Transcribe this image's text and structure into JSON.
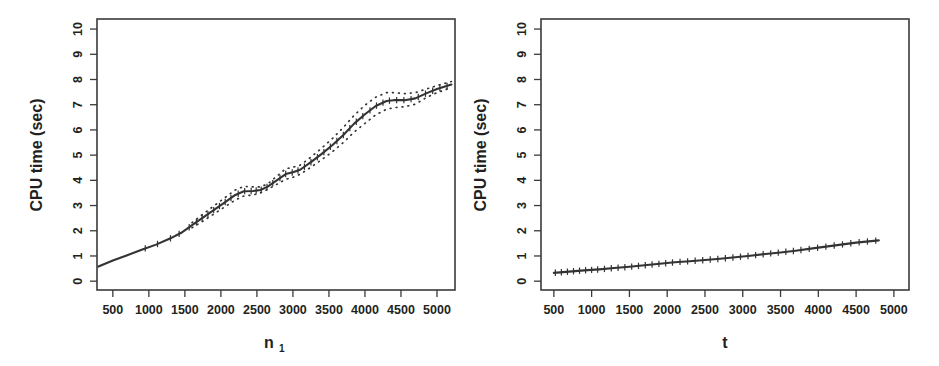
{
  "figure": {
    "title": "",
    "background_color": "#ffffff",
    "line_color": "#333333",
    "axis_color": "#3a3a3a"
  },
  "chart_data": [
    {
      "type": "line",
      "panel": "left",
      "title": "",
      "xlabel": "n₁",
      "xlabel_base": "n",
      "xlabel_subscript": "1",
      "ylabel": "CPU time (sec)",
      "xlim": [
        280,
        5250
      ],
      "ylim": [
        -0.35,
        10.4
      ],
      "xticks": [
        500,
        1000,
        1500,
        2000,
        2500,
        3000,
        3500,
        4000,
        4500,
        5000
      ],
      "xticklabels": [
        "500",
        "1000",
        "1500",
        "2000",
        "2500",
        "3000",
        "3500",
        "4000",
        "4500",
        "5000"
      ],
      "yticks": [
        0,
        1,
        2,
        3,
        4,
        5,
        6,
        7,
        8,
        9,
        10
      ],
      "yticklabels": [
        "0",
        "1",
        "2",
        "3",
        "4",
        "5",
        "6",
        "7",
        "8",
        "9",
        "10"
      ],
      "grid": false,
      "legend": "none",
      "series": [
        {
          "name": "fit",
          "style": "solid",
          "x": [
            300,
            500,
            700,
            900,
            1100,
            1300,
            1450,
            1600,
            1750,
            1900,
            2050,
            2200,
            2320,
            2450,
            2550,
            2650,
            2800,
            2900,
            3000,
            3100,
            3250,
            3400,
            3550,
            3700,
            3850,
            4000,
            4150,
            4300,
            4400,
            4550,
            4700,
            4850,
            5000,
            5200
          ],
          "y": [
            0.58,
            0.82,
            1.03,
            1.25,
            1.45,
            1.7,
            1.92,
            2.22,
            2.52,
            2.82,
            3.12,
            3.42,
            3.57,
            3.58,
            3.62,
            3.75,
            4.05,
            4.25,
            4.32,
            4.42,
            4.72,
            5.05,
            5.4,
            5.8,
            6.25,
            6.62,
            6.95,
            7.15,
            7.18,
            7.18,
            7.25,
            7.45,
            7.62,
            7.8
          ]
        },
        {
          "name": "upper band",
          "style": "dotted",
          "x": [
            1600,
            1750,
            1900,
            2050,
            2200,
            2320,
            2450,
            2550,
            2650,
            2800,
            2900,
            3000,
            3100,
            3250,
            3400,
            3550,
            3700,
            3850,
            4000,
            4150,
            4300,
            4400,
            4550,
            4700,
            4850,
            5000,
            5200
          ],
          "y": [
            2.32,
            2.66,
            2.98,
            3.3,
            3.62,
            3.76,
            3.74,
            3.74,
            3.86,
            4.22,
            4.46,
            4.52,
            4.6,
            4.92,
            5.28,
            5.66,
            6.1,
            6.58,
            6.98,
            7.3,
            7.48,
            7.48,
            7.44,
            7.48,
            7.62,
            7.76,
            7.92
          ]
        },
        {
          "name": "lower band",
          "style": "dotted",
          "x": [
            1600,
            1750,
            1900,
            2050,
            2200,
            2320,
            2450,
            2550,
            2650,
            2800,
            2900,
            3000,
            3100,
            3250,
            3400,
            3550,
            3700,
            3850,
            4000,
            4150,
            4300,
            4400,
            4550,
            4700,
            4850,
            5000,
            5200
          ],
          "y": [
            2.12,
            2.38,
            2.66,
            2.94,
            3.22,
            3.38,
            3.42,
            3.5,
            3.64,
            3.88,
            4.04,
            4.12,
            4.24,
            4.52,
            4.82,
            5.14,
            5.5,
            5.92,
            6.26,
            6.6,
            6.82,
            6.88,
            6.92,
            7.02,
            7.28,
            7.48,
            7.68
          ]
        }
      ],
      "rug_x": [
        950,
        1120,
        1300,
        1420,
        1560,
        1660,
        1740,
        1820,
        1900,
        1980,
        2060,
        2140,
        2240,
        2330,
        2420,
        2490,
        2560,
        2640,
        2720,
        2820,
        2900,
        2990,
        3070,
        3160,
        3250,
        3340,
        3430,
        3520,
        3610,
        3700,
        3790,
        3880,
        3970,
        4070,
        4160,
        4250,
        4340,
        4440,
        4540,
        4640,
        4740,
        4840,
        4940,
        5040,
        5140
      ]
    },
    {
      "type": "line",
      "panel": "right",
      "title": "",
      "xlabel": "t",
      "ylabel": "CPU time (sec)",
      "xlim": [
        330,
        5200
      ],
      "ylim": [
        -0.35,
        10.4
      ],
      "xticks": [
        500,
        1000,
        1500,
        2000,
        2500,
        3000,
        3500,
        4000,
        4500,
        5000
      ],
      "xticklabels": [
        "500",
        "1000",
        "1500",
        "2000",
        "2500",
        "3000",
        "3500",
        "4000",
        "4500",
        "5000"
      ],
      "yticks": [
        0,
        1,
        2,
        3,
        4,
        5,
        6,
        7,
        8,
        9,
        10
      ],
      "yticklabels": [
        "0",
        "1",
        "2",
        "3",
        "4",
        "5",
        "6",
        "7",
        "8",
        "9",
        "10"
      ],
      "grid": false,
      "legend": "none",
      "series": [
        {
          "name": "fit",
          "style": "solid",
          "x": [
            500,
            700,
            900,
            1100,
            1300,
            1500,
            1700,
            1900,
            2100,
            2300,
            2500,
            2700,
            2900,
            3100,
            3300,
            3500,
            3700,
            3900,
            4100,
            4300,
            4500,
            4700,
            4800
          ],
          "y": [
            0.33,
            0.38,
            0.43,
            0.47,
            0.52,
            0.57,
            0.63,
            0.69,
            0.75,
            0.79,
            0.84,
            0.89,
            0.95,
            1.01,
            1.08,
            1.14,
            1.21,
            1.29,
            1.37,
            1.45,
            1.53,
            1.59,
            1.62
          ]
        }
      ],
      "rug_x": [
        520,
        600,
        680,
        760,
        840,
        920,
        1000,
        1080,
        1170,
        1260,
        1350,
        1440,
        1530,
        1620,
        1710,
        1800,
        1890,
        1980,
        2070,
        2170,
        2270,
        2370,
        2470,
        2570,
        2670,
        2770,
        2870,
        2970,
        3070,
        3170,
        3270,
        3370,
        3470,
        3570,
        3670,
        3770,
        3880,
        3990,
        4100,
        4210,
        4320,
        4430,
        4540,
        4650,
        4760
      ]
    }
  ]
}
